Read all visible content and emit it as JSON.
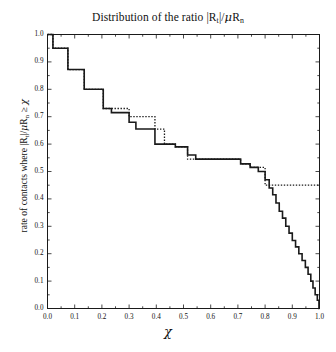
{
  "chart_data": {
    "type": "line",
    "title_parts": {
      "lead": "Distribution of the ratio ",
      "bar1": "|R",
      "sub1": "t",
      "bar2": "|/",
      "mu": "μ",
      "rn": "R",
      "sub2": "n"
    },
    "xlabel": "χ",
    "ylabel": "rate of contacts where |R_t|/μR_n ≥ χ",
    "ylabel_parts": {
      "lead": "rate of contacts where ",
      "bar1": "|R",
      "sub1": "t",
      "bar2": "|/",
      "mu": "μ",
      "rn": "R",
      "sub2": "n",
      "ge": " ≥ ",
      "chi": "χ"
    },
    "xlim": [
      0.0,
      1.0
    ],
    "ylim": [
      0.0,
      1.0
    ],
    "xticks": [
      "0.0",
      "0.1",
      "0.2",
      "0.3",
      "0.4",
      "0.5",
      "0.6",
      "0.7",
      "0.8",
      "0.9",
      "1.0"
    ],
    "yticks": [
      "0.0",
      "0.1",
      "0.2",
      "0.3",
      "0.4",
      "0.5",
      "0.6",
      "0.7",
      "0.8",
      "0.9",
      "1.0"
    ],
    "xtick_values": [
      0.0,
      0.1,
      0.2,
      0.3,
      0.4,
      0.5,
      0.6,
      0.7,
      0.8,
      0.9,
      1.0
    ],
    "ytick_values": [
      0.0,
      0.1,
      0.2,
      0.3,
      0.4,
      0.5,
      0.6,
      0.7,
      0.8,
      0.9,
      1.0
    ],
    "grid": false,
    "legend": null,
    "frame": "box",
    "tick_direction": "in",
    "series": [
      {
        "name": "solid-curve",
        "style": "solid",
        "color": "#1a1a1a",
        "width": 1.6,
        "step": "post",
        "points": [
          [
            0.0,
            1.0
          ],
          [
            0.02,
            1.0
          ],
          [
            0.02,
            0.95
          ],
          [
            0.075,
            0.95
          ],
          [
            0.075,
            0.872
          ],
          [
            0.135,
            0.872
          ],
          [
            0.135,
            0.8
          ],
          [
            0.205,
            0.8
          ],
          [
            0.205,
            0.73
          ],
          [
            0.235,
            0.73
          ],
          [
            0.235,
            0.715
          ],
          [
            0.3,
            0.715
          ],
          [
            0.3,
            0.68
          ],
          [
            0.325,
            0.68
          ],
          [
            0.325,
            0.655
          ],
          [
            0.395,
            0.655
          ],
          [
            0.395,
            0.6
          ],
          [
            0.47,
            0.6
          ],
          [
            0.47,
            0.59
          ],
          [
            0.515,
            0.59
          ],
          [
            0.515,
            0.56
          ],
          [
            0.545,
            0.56
          ],
          [
            0.545,
            0.545
          ],
          [
            0.71,
            0.545
          ],
          [
            0.71,
            0.528
          ],
          [
            0.745,
            0.528
          ],
          [
            0.745,
            0.515
          ],
          [
            0.775,
            0.515
          ],
          [
            0.775,
            0.5
          ],
          [
            0.8,
            0.5
          ],
          [
            0.8,
            0.47
          ],
          [
            0.815,
            0.47
          ],
          [
            0.815,
            0.44
          ],
          [
            0.828,
            0.44
          ],
          [
            0.828,
            0.415
          ],
          [
            0.84,
            0.415
          ],
          [
            0.84,
            0.385
          ],
          [
            0.852,
            0.385
          ],
          [
            0.852,
            0.355
          ],
          [
            0.864,
            0.355
          ],
          [
            0.864,
            0.33
          ],
          [
            0.876,
            0.33
          ],
          [
            0.876,
            0.3
          ],
          [
            0.888,
            0.3
          ],
          [
            0.888,
            0.275
          ],
          [
            0.9,
            0.275
          ],
          [
            0.9,
            0.248
          ],
          [
            0.912,
            0.248
          ],
          [
            0.912,
            0.225
          ],
          [
            0.924,
            0.225
          ],
          [
            0.924,
            0.2
          ],
          [
            0.936,
            0.2
          ],
          [
            0.936,
            0.175
          ],
          [
            0.948,
            0.175
          ],
          [
            0.948,
            0.15
          ],
          [
            0.958,
            0.15
          ],
          [
            0.958,
            0.125
          ],
          [
            0.968,
            0.125
          ],
          [
            0.968,
            0.1
          ],
          [
            0.976,
            0.1
          ],
          [
            0.976,
            0.075
          ],
          [
            0.984,
            0.075
          ],
          [
            0.984,
            0.05
          ],
          [
            0.992,
            0.05
          ],
          [
            0.992,
            0.03
          ],
          [
            0.998,
            0.03
          ],
          [
            0.998,
            0.0
          ],
          [
            1.0,
            0.0
          ]
        ]
      },
      {
        "name": "dotted-curve",
        "style": "dotted",
        "color": "#1a1a1a",
        "width": 1.3,
        "step": "post",
        "points": [
          [
            0.0,
            1.0
          ],
          [
            0.02,
            1.0
          ],
          [
            0.02,
            0.95
          ],
          [
            0.075,
            0.95
          ],
          [
            0.075,
            0.872
          ],
          [
            0.135,
            0.872
          ],
          [
            0.135,
            0.8
          ],
          [
            0.205,
            0.8
          ],
          [
            0.205,
            0.73
          ],
          [
            0.3,
            0.73
          ],
          [
            0.3,
            0.7
          ],
          [
            0.395,
            0.7
          ],
          [
            0.395,
            0.655
          ],
          [
            0.43,
            0.655
          ],
          [
            0.43,
            0.6
          ],
          [
            0.47,
            0.6
          ],
          [
            0.47,
            0.59
          ],
          [
            0.515,
            0.59
          ],
          [
            0.515,
            0.545
          ],
          [
            0.71,
            0.545
          ],
          [
            0.71,
            0.528
          ],
          [
            0.745,
            0.528
          ],
          [
            0.745,
            0.515
          ],
          [
            0.8,
            0.515
          ],
          [
            0.8,
            0.45
          ],
          [
            1.0,
            0.45
          ]
        ]
      }
    ]
  }
}
